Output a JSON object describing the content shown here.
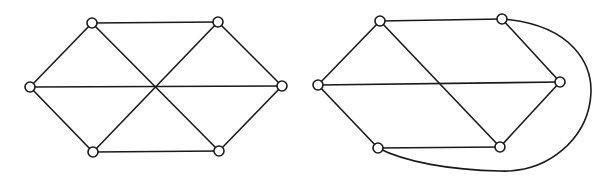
{
  "diagram": {
    "graphs": [
      {
        "id": "left",
        "description": "Hexagon with three long diagonals meeting at center",
        "node_radius": 5,
        "nodes": [
          {
            "id": "a",
            "x": 92,
            "y": 23
          },
          {
            "id": "b",
            "x": 218,
            "y": 22
          },
          {
            "id": "c",
            "x": 282,
            "y": 86
          },
          {
            "id": "d",
            "x": 219,
            "y": 151
          },
          {
            "id": "e",
            "x": 93,
            "y": 152
          },
          {
            "id": "f",
            "x": 30,
            "y": 87
          }
        ],
        "edges": [
          {
            "from": "a",
            "to": "b"
          },
          {
            "from": "b",
            "to": "c"
          },
          {
            "from": "c",
            "to": "d"
          },
          {
            "from": "d",
            "to": "e"
          },
          {
            "from": "e",
            "to": "f"
          },
          {
            "from": "f",
            "to": "a"
          },
          {
            "from": "a",
            "to": "d"
          },
          {
            "from": "b",
            "to": "e"
          },
          {
            "from": "f",
            "to": "c"
          }
        ]
      },
      {
        "id": "right",
        "description": "Same graph redrawn with one diagonal routed as an outer curve",
        "node_radius": 5,
        "nodes": [
          {
            "id": "a",
            "x": 380,
            "y": 21
          },
          {
            "id": "b",
            "x": 502,
            "y": 19
          },
          {
            "id": "c",
            "x": 560,
            "y": 82
          },
          {
            "id": "d",
            "x": 500,
            "y": 147
          },
          {
            "id": "e",
            "x": 378,
            "y": 148
          },
          {
            "id": "f",
            "x": 318,
            "y": 85
          }
        ],
        "edges": [
          {
            "from": "a",
            "to": "b"
          },
          {
            "from": "b",
            "to": "c"
          },
          {
            "from": "c",
            "to": "d"
          },
          {
            "from": "d",
            "to": "e"
          },
          {
            "from": "e",
            "to": "f"
          },
          {
            "from": "f",
            "to": "a"
          },
          {
            "from": "a",
            "to": "d"
          },
          {
            "from": "f",
            "to": "c"
          },
          {
            "from": "b",
            "to": "e",
            "curve": "M 502 19 C 640 30, 600 175, 500 171 C 450 170, 405 162, 378 148"
          }
        ]
      }
    ],
    "colors": {
      "stroke": "#1a1a1a",
      "node_fill": "#ffffff",
      "background": "#ffffff"
    }
  }
}
